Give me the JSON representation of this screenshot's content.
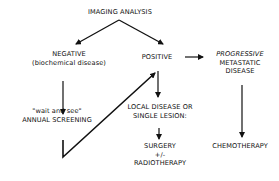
{
  "diagram": {
    "type": "flowchart",
    "nodes": {
      "root": {
        "lines": [
          "IMAGING ANALYSIS"
        ]
      },
      "negative": {
        "lines": [
          "NEGATIVE",
          "(biochemical disease)"
        ]
      },
      "positive": {
        "lines": [
          "POSITIVE"
        ]
      },
      "progressive": {
        "lines": [
          "PROGRESSIVE",
          "METASTATIC",
          "DISEASE"
        ]
      },
      "wait": {
        "lines": [
          "\"wait and see\"",
          "ANNUAL SCREENING"
        ]
      },
      "local": {
        "lines": [
          "LOCAL DISEASE OR",
          "SINGLE LESION:"
        ]
      },
      "surgery": {
        "lines": [
          "SURGERY",
          "+/-",
          "RADIOTHERAPY"
        ]
      },
      "chemo": {
        "lines": [
          "CHEMOTHERAPY"
        ]
      }
    },
    "edges": [
      {
        "from": "root",
        "to": "negative"
      },
      {
        "from": "root",
        "to": "positive"
      },
      {
        "from": "positive",
        "to": "progressive"
      },
      {
        "from": "negative",
        "to": "wait"
      },
      {
        "from": "wait",
        "to": "positive",
        "note": "V-shaped return line"
      },
      {
        "from": "positive",
        "to": "local"
      },
      {
        "from": "local",
        "to": "surgery"
      },
      {
        "from": "progressive",
        "to": "chemo"
      }
    ],
    "colors": {
      "line": "#111111",
      "text": "#111111",
      "background": "#ffffff"
    }
  }
}
